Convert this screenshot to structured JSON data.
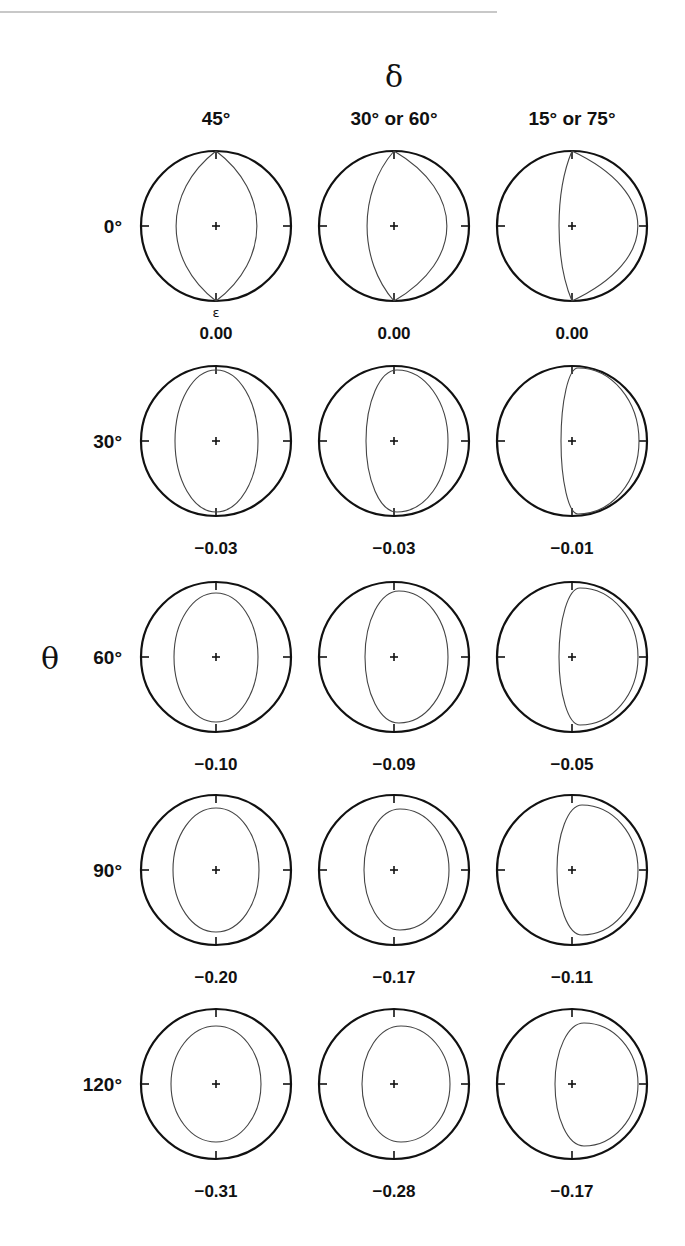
{
  "figure": {
    "column_axis_symbol": "δ",
    "row_axis_symbol": "θ",
    "epsilon_label": "ε",
    "columns": [
      {
        "label": "45°",
        "main": "45",
        "deg": "°"
      },
      {
        "label": "30° or 60°"
      },
      {
        "label": "15° or 75°"
      }
    ],
    "rows": [
      {
        "label": "0°",
        "values": [
          "0.00",
          "0.00",
          "0.00"
        ]
      },
      {
        "label": "30°",
        "values": [
          "−0.03",
          "−0.03",
          "−0.01"
        ]
      },
      {
        "label": "60°",
        "values": [
          "−0.10",
          "−0.09",
          "−0.05"
        ]
      },
      {
        "label": "90°",
        "values": [
          "−0.20",
          "−0.17",
          "−0.11"
        ]
      },
      {
        "label": "120°",
        "values": [
          "−0.31",
          "−0.28",
          "−0.17"
        ]
      }
    ]
  },
  "chart_data": {
    "type": "table",
    "title": "",
    "column_variable": "δ",
    "row_variable": "θ",
    "cell_value_label": "ε",
    "columns": [
      "45°",
      "30° or 60°",
      "15° or 75°"
    ],
    "rows": [
      "0°",
      "30°",
      "60°",
      "90°",
      "120°"
    ],
    "values": [
      [
        0.0,
        0.0,
        0.0
      ],
      [
        -0.03,
        -0.03,
        -0.01
      ],
      [
        -0.1,
        -0.09,
        -0.05
      ],
      [
        -0.2,
        -0.17,
        -0.11
      ],
      [
        -0.31,
        -0.28,
        -0.17
      ]
    ]
  },
  "layout": {
    "col_x": [
      216,
      394,
      572
    ],
    "row_y": [
      226,
      441,
      657,
      870,
      1084
    ],
    "radius": 75,
    "shapes": [
      [
        {
          "kind": "lens",
          "l": 40,
          "r": 41
        },
        {
          "kind": "lens",
          "l": 27,
          "r": 53
        },
        {
          "kind": "lens",
          "l": 13,
          "r": 66
        }
      ],
      [
        {
          "kind": "blob",
          "l": 41,
          "r": 42,
          "t": 71,
          "b": 71,
          "sx": 0
        },
        {
          "kind": "blob",
          "l": 28,
          "r": 54,
          "t": 71,
          "b": 71,
          "sx": 3
        },
        {
          "kind": "blob",
          "l": 11,
          "r": 67,
          "t": 73,
          "b": 73,
          "sx": 6
        }
      ],
      [
        {
          "kind": "blob",
          "l": 42,
          "r": 42,
          "t": 64,
          "b": 65,
          "sx": 0
        },
        {
          "kind": "blob",
          "l": 29,
          "r": 54,
          "t": 66,
          "b": 66,
          "sx": 5
        },
        {
          "kind": "blob",
          "l": 13,
          "r": 66,
          "t": 69,
          "b": 68,
          "sx": 8
        }
      ],
      [
        {
          "kind": "blob",
          "l": 43,
          "r": 43,
          "t": 62,
          "b": 62,
          "sx": 0
        },
        {
          "kind": "blob",
          "l": 30,
          "r": 55,
          "t": 61,
          "b": 60,
          "sx": 6
        },
        {
          "kind": "blob",
          "l": 15,
          "r": 66,
          "t": 65,
          "b": 65,
          "sx": 10
        }
      ],
      [
        {
          "kind": "blob",
          "l": 45,
          "r": 45,
          "t": 58,
          "b": 58,
          "sx": 0
        },
        {
          "kind": "blob",
          "l": 32,
          "r": 56,
          "t": 58,
          "b": 58,
          "sx": 7
        },
        {
          "kind": "blob",
          "l": 17,
          "r": 66,
          "t": 61,
          "b": 62,
          "sx": 12
        }
      ]
    ]
  }
}
